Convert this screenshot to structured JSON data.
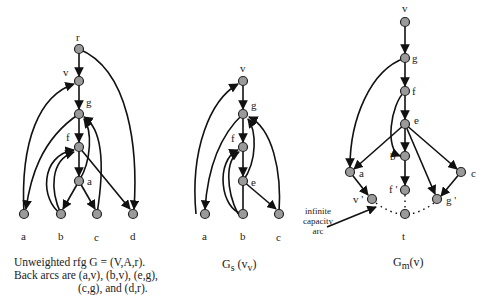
{
  "figure": {
    "left": {
      "title": "Unweighted rfg G = (V,A,r).",
      "caption_line2": "Back arcs are (a,v), (b,v), (e,g),",
      "caption_line3": "(c,g), and (d,r).",
      "nodes": [
        {
          "id": "r",
          "label": "r",
          "x": 79,
          "y": 49
        },
        {
          "id": "v",
          "label": "v",
          "x": 79,
          "y": 81
        },
        {
          "id": "g",
          "label": "g",
          "x": 79,
          "y": 114
        },
        {
          "id": "f",
          "label": "f",
          "x": 79,
          "y": 147
        },
        {
          "id": "e",
          "label": "a",
          "x": 79,
          "y": 181
        },
        {
          "id": "a",
          "label": "a",
          "x": 24,
          "y": 214
        },
        {
          "id": "b",
          "label": "b",
          "x": 61,
          "y": 214
        },
        {
          "id": "c",
          "label": "c",
          "x": 97,
          "y": 214
        },
        {
          "id": "d",
          "label": "d",
          "x": 133,
          "y": 214
        }
      ]
    },
    "middle": {
      "title_main": "G",
      "title_sub": "s",
      "title_arg": "(v",
      "title_argsub": "v",
      "title_close": ")",
      "nodes": [
        {
          "id": "v",
          "label": "v",
          "x": 243,
          "y": 81
        },
        {
          "id": "g",
          "label": "g",
          "x": 243,
          "y": 114
        },
        {
          "id": "f",
          "label": "f",
          "x": 243,
          "y": 147
        },
        {
          "id": "e",
          "label": "e",
          "x": 243,
          "y": 181
        },
        {
          "id": "a",
          "label": "a",
          "x": 205,
          "y": 214
        },
        {
          "id": "b",
          "label": "b",
          "x": 243,
          "y": 214
        },
        {
          "id": "c",
          "label": "c",
          "x": 279,
          "y": 214
        }
      ]
    },
    "right": {
      "title_main": "G",
      "title_sub": "m",
      "title_arg": "(v)",
      "annotation": [
        "infinite",
        "capacity",
        "arc"
      ],
      "nodes": [
        {
          "id": "v",
          "label": "v",
          "x": 405,
          "y": 22
        },
        {
          "id": "g",
          "label": "g",
          "x": 405,
          "y": 58
        },
        {
          "id": "f",
          "label": "f",
          "x": 405,
          "y": 91
        },
        {
          "id": "e",
          "label": "e",
          "x": 405,
          "y": 124
        },
        {
          "id": "b",
          "label": "b",
          "x": 405,
          "y": 156
        },
        {
          "id": "a",
          "label": "a",
          "x": 350,
          "y": 172
        },
        {
          "id": "c",
          "label": "c",
          "x": 461,
          "y": 172
        },
        {
          "id": "f2",
          "label": "f '",
          "x": 405,
          "y": 190
        },
        {
          "id": "v2",
          "label": "v '",
          "x": 372,
          "y": 199
        },
        {
          "id": "g2",
          "label": "g '",
          "x": 437,
          "y": 199
        },
        {
          "id": "t",
          "label": "t",
          "x": 405,
          "y": 214
        }
      ]
    }
  }
}
